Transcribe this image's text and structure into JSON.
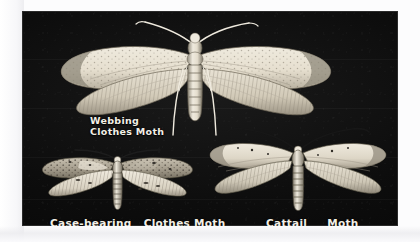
{
  "figure": {
    "medium": "black-and-white photographic plate",
    "background_color": "#0b0b0b",
    "paper_color": "#fcfcfd",
    "label_color": "#f2efe6",
    "plate": {
      "x": 22,
      "y": 11,
      "width": 376,
      "height": 215
    }
  },
  "specimens": [
    {
      "id": "webbing-clothes-moth",
      "common_name_line1": "Webbing",
      "common_name_line2": "Clothes Moth",
      "position": "top-center",
      "relative_size": "largest",
      "wing_color": "pale cream / straw",
      "features": "long slender antennae, speckled forewings, fringed hind margins, segmented abdomen, two long trailing legs"
    },
    {
      "id": "case-bearing-clothes-moth",
      "common_name_part1": "Case-bearing",
      "common_name_part2": "Clothes Moth",
      "position": "bottom-left",
      "relative_size": "smallest",
      "wing_color": "mottled grey-brown with dark speckles",
      "features": "dark spotted forewings, pale hindwings, stout ringed abdomen"
    },
    {
      "id": "cattail-moth",
      "common_name_part1": "Cattail",
      "common_name_part2": "Moth",
      "position": "bottom-right",
      "relative_size": "medium",
      "wing_color": "pale cream with fine dark flecks",
      "features": "very long upswept antennae, narrow pointed forewings, broad fringed hindwings"
    }
  ],
  "labels": {
    "webbing_line1": "Webbing",
    "webbing_line2": "Clothes Moth",
    "casebearing_part1": "Case-bearing",
    "casebearing_part2": "Clothes Moth",
    "cattail_part1": "Cattail",
    "cattail_part2": "Moth"
  }
}
